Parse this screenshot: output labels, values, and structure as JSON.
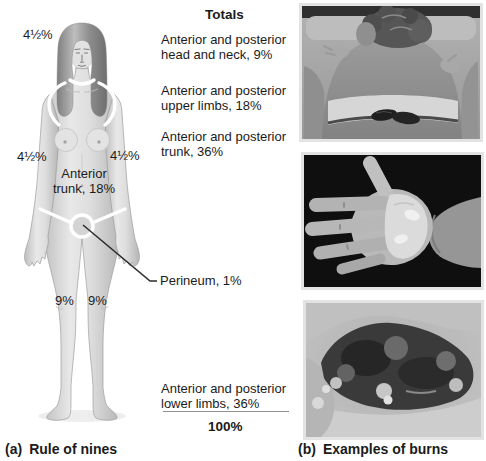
{
  "figure": {
    "panel_a": {
      "caption_prefix": "(a)",
      "caption": "Rule of nines",
      "body_labels": {
        "head_pct": "4½%",
        "left_arm_pct": "4½%",
        "right_arm_pct": "4½%",
        "trunk_line1": "Anterior",
        "trunk_line2": "trunk, 18%",
        "left_leg_pct": "9%",
        "right_leg_pct": "9%",
        "perineum": "Perineum, 1%"
      }
    },
    "totals": {
      "title": "Totals",
      "items": [
        {
          "line1": "Anterior and posterior",
          "line2": "head and neck, 9%"
        },
        {
          "line1": "Anterior and posterior",
          "line2": "upper limbs, 18%"
        },
        {
          "line1": "Anterior and posterior",
          "line2": "trunk, 36%"
        },
        {
          "line1": "Anterior and posterior",
          "line2": "lower limbs, 36%"
        }
      ],
      "grand_total": "100%"
    },
    "panel_b": {
      "caption_prefix": "(b)",
      "caption": "Examples of burns"
    },
    "colors": {
      "label_text": "#1b1b1b",
      "leader_line": "#2d2d2d",
      "region_divider": "#ffffff"
    }
  }
}
